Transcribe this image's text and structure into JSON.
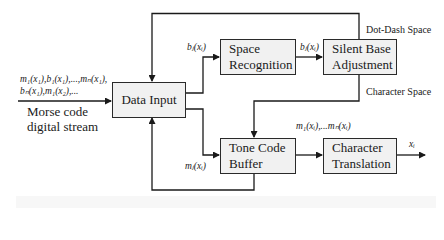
{
  "diagram": {
    "type": "block-flowchart",
    "blocks": {
      "data_input": "Data Input",
      "space_recognition_line1": "Space",
      "space_recognition_line2": "Recognition",
      "silent_base_line1": "Silent Base",
      "silent_base_line2": "Adjustment",
      "tone_code_line1": "Tone Code",
      "tone_code_line2": "Buffer",
      "char_translation_line1": "Character",
      "char_translation_line2": "Translation"
    },
    "input": {
      "sequence_line1": "m₁(x₁),b₁(x₁),...,mₙ(x₁),",
      "sequence_line2": "bₙ(x₁),m₁(x₂),...",
      "stream_line1": "Morse code",
      "stream_line2": "digital stream"
    },
    "edge_labels": {
      "to_space_recognition": "bⱼ(xᵢ)",
      "to_silent_base": "bⱼ(xᵢ)",
      "dot_dash_space": "Dot-Dash Space",
      "character_space": "Character Space",
      "to_tone_buffer": "mⱼ(xᵢ)",
      "to_char_translation": "m₁(xᵢ),...mₙ(xᵢ)",
      "output": "xᵢ"
    },
    "colors": {
      "line": "#1a1a1a",
      "box_fill": "#f1f1f1",
      "box_border": "#2a2a2a"
    }
  }
}
